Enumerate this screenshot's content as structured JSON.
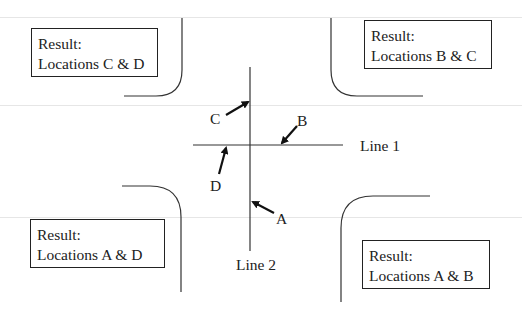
{
  "boxes": {
    "top_left": {
      "line1": "Result:",
      "line2": "Locations C & D"
    },
    "top_right": {
      "line1": "Result:",
      "line2": "Locations B & C"
    },
    "bottom_left": {
      "line1": "Result:",
      "line2": "Locations A & D"
    },
    "bottom_right": {
      "line1": "Result:",
      "line2": "Locations A & B"
    }
  },
  "lines": {
    "line1_label": "Line 1",
    "line2_label": "Line 2"
  },
  "points": {
    "a": "A",
    "b": "B",
    "c": "C",
    "d": "D"
  },
  "colors": {
    "stroke": "#333333",
    "text": "#222222",
    "faint_rule": "#e6e6e6"
  }
}
